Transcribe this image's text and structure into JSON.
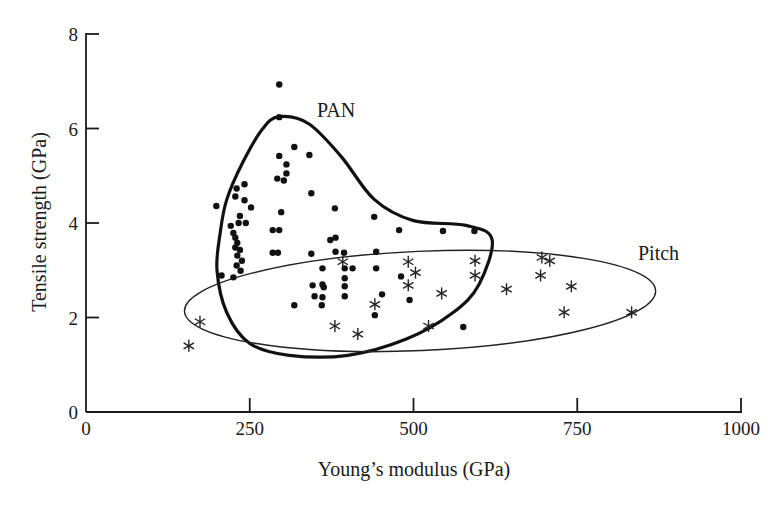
{
  "chart_data": {
    "type": "scatter",
    "title": "",
    "xlabel": "Young’s modulus (GPa)",
    "ylabel": "Tensile strength (GPa)",
    "xlim": [
      0,
      1000
    ],
    "ylim": [
      0,
      8
    ],
    "x_ticks": [
      0,
      250,
      500,
      750,
      1000
    ],
    "y_ticks": [
      0,
      2,
      4,
      6,
      8
    ],
    "x_tick_labels": [
      "0",
      "250",
      "500",
      "750",
      "1000"
    ],
    "y_tick_labels": [
      "0",
      "2",
      "4",
      "6",
      "8"
    ],
    "grid": false,
    "legend": null,
    "annotations": [
      {
        "text": "PAN",
        "x": 355,
        "y": 6.4
      },
      {
        "text": "Pitch",
        "x": 845,
        "y": 3.3
      }
    ],
    "series": [
      {
        "name": "PAN",
        "marker": "dot",
        "points": [
          [
            295,
            6.93
          ],
          [
            295,
            6.24
          ],
          [
            318,
            5.61
          ],
          [
            295,
            5.42
          ],
          [
            341,
            5.44
          ],
          [
            306,
            5.24
          ],
          [
            306,
            5.05
          ],
          [
            292,
            4.94
          ],
          [
            302,
            4.9
          ],
          [
            344,
            4.63
          ],
          [
            230,
            4.73
          ],
          [
            242,
            4.82
          ],
          [
            228,
            4.56
          ],
          [
            242,
            4.48
          ],
          [
            252,
            4.33
          ],
          [
            199,
            4.36
          ],
          [
            298,
            4.23
          ],
          [
            380,
            4.31
          ],
          [
            440,
            4.13
          ],
          [
            478,
            3.85
          ],
          [
            545,
            3.83
          ],
          [
            593,
            3.83
          ],
          [
            235,
            4.15
          ],
          [
            233,
            4.0
          ],
          [
            244,
            4.0
          ],
          [
            221,
            3.94
          ],
          [
            225,
            3.79
          ],
          [
            228,
            3.69
          ],
          [
            231,
            3.58
          ],
          [
            228,
            3.48
          ],
          [
            235,
            3.43
          ],
          [
            231,
            3.31
          ],
          [
            238,
            3.2
          ],
          [
            230,
            3.1
          ],
          [
            236,
            2.99
          ],
          [
            225,
            2.85
          ],
          [
            207,
            2.89
          ],
          [
            285,
            3.85
          ],
          [
            295,
            3.85
          ],
          [
            285,
            3.37
          ],
          [
            293,
            3.37
          ],
          [
            373,
            3.64
          ],
          [
            381,
            3.69
          ],
          [
            344,
            3.35
          ],
          [
            381,
            3.39
          ],
          [
            394,
            3.37
          ],
          [
            443,
            3.39
          ],
          [
            361,
            3.04
          ],
          [
            395,
            3.04
          ],
          [
            407,
            3.04
          ],
          [
            443,
            3.04
          ],
          [
            395,
            2.83
          ],
          [
            481,
            2.87
          ],
          [
            346,
            2.68
          ],
          [
            361,
            2.7
          ],
          [
            363,
            2.64
          ],
          [
            395,
            2.66
          ],
          [
            349,
            2.45
          ],
          [
            361,
            2.43
          ],
          [
            395,
            2.45
          ],
          [
            360,
            2.26
          ],
          [
            318,
            2.26
          ],
          [
            452,
            2.49
          ],
          [
            494,
            2.37
          ],
          [
            441,
            2.05
          ],
          [
            576,
            1.8
          ]
        ]
      },
      {
        "name": "Pitch",
        "marker": "star",
        "points": [
          [
            157,
            1.4
          ],
          [
            174,
            1.91
          ],
          [
            392,
            3.18
          ],
          [
            492,
            3.18
          ],
          [
            503,
            2.95
          ],
          [
            492,
            2.68
          ],
          [
            594,
            3.2
          ],
          [
            594,
            2.89
          ],
          [
            543,
            2.51
          ],
          [
            441,
            2.28
          ],
          [
            380,
            1.82
          ],
          [
            415,
            1.65
          ],
          [
            523,
            1.82
          ],
          [
            642,
            2.6
          ],
          [
            696,
            3.27
          ],
          [
            708,
            3.2
          ],
          [
            694,
            2.89
          ],
          [
            741,
            2.66
          ],
          [
            730,
            2.11
          ],
          [
            833,
            2.11
          ]
        ]
      }
    ],
    "regions": [
      {
        "name": "PAN",
        "style": "thick closed curve",
        "outline": [
          [
            295,
            6.25
          ],
          [
            340,
            6.1
          ],
          [
            390,
            5.4
          ],
          [
            440,
            4.5
          ],
          [
            500,
            4.05
          ],
          [
            580,
            3.95
          ],
          [
            620,
            3.65
          ],
          [
            600,
            2.7
          ],
          [
            560,
            2.1
          ],
          [
            490,
            1.55
          ],
          [
            400,
            1.2
          ],
          [
            310,
            1.2
          ],
          [
            250,
            1.45
          ],
          [
            215,
            2.1
          ],
          [
            200,
            3.0
          ],
          [
            205,
            3.8
          ],
          [
            215,
            4.5
          ],
          [
            240,
            5.3
          ],
          [
            270,
            6.0
          ]
        ]
      },
      {
        "name": "Pitch",
        "style": "thin ellipse",
        "center": [
          510,
          2.35
        ],
        "rx": 360,
        "ry": 1.05,
        "rotation_deg": -2.5
      }
    ]
  }
}
